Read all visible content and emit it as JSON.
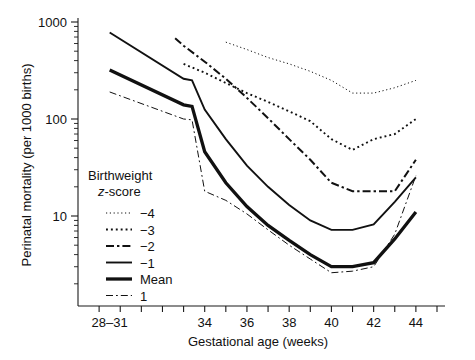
{
  "chart_data": {
    "type": "line",
    "title": "",
    "xlabel": "Gestational age (weeks)",
    "ylabel": "Perinatal mortality (per 1000 births)",
    "yscale": "log",
    "ylim": [
      1.2,
      1000
    ],
    "ytick_labels": [
      "1000",
      "100",
      "10"
    ],
    "ytick_values": [
      1000,
      100,
      10
    ],
    "xtick_labels": [
      "28–31",
      "34",
      "36",
      "38",
      "40",
      "42",
      "44"
    ],
    "xtick_values": [
      29.5,
      34,
      36,
      38,
      40,
      42,
      44
    ],
    "xlim": [
      28,
      45
    ],
    "grid": false,
    "legend_position": "inside-lower-left",
    "legend_title_line1": "Birthweight",
    "legend_title_line2_italic": "z",
    "legend_title_line2_rest": "-score",
    "series": [
      {
        "name": "−4",
        "style": "fine-dotted",
        "x": [
          35,
          36,
          37,
          38,
          39,
          40,
          41,
          42,
          43,
          44
        ],
        "values": [
          620,
          520,
          430,
          370,
          310,
          250,
          185,
          185,
          210,
          250
        ]
      },
      {
        "name": "−3",
        "style": "dotted",
        "x": [
          33,
          34,
          35,
          36,
          37,
          38,
          39,
          40,
          41,
          42,
          43,
          44
        ],
        "values": [
          370,
          300,
          235,
          185,
          150,
          120,
          95,
          62,
          48,
          62,
          70,
          100
        ]
      },
      {
        "name": "−2",
        "style": "dash-dot",
        "x": [
          32.6,
          33,
          34,
          35,
          36,
          37,
          38,
          39,
          40,
          41,
          42,
          43,
          44
        ],
        "values": [
          680,
          570,
          390,
          260,
          165,
          102,
          62,
          38,
          22,
          18,
          18,
          18,
          38
        ]
      },
      {
        "name": "−1",
        "style": "solid-thin",
        "x": [
          29.5,
          33,
          33.4,
          34,
          35,
          36,
          37,
          38,
          39,
          40,
          41,
          42,
          43,
          44
        ],
        "values": [
          780,
          260,
          250,
          125,
          62,
          33,
          20,
          13,
          9.0,
          7.2,
          7.2,
          8.2,
          14,
          25
        ]
      },
      {
        "name": "Mean",
        "style": "solid-thick",
        "x": [
          29.5,
          33,
          33.4,
          34,
          35,
          36,
          37,
          38,
          39,
          40,
          41,
          42,
          43,
          44
        ],
        "values": [
          320,
          140,
          135,
          46,
          22,
          12.5,
          8.0,
          5.6,
          4.0,
          3.0,
          3.0,
          3.3,
          5.8,
          11
        ]
      },
      {
        "name": "1",
        "style": "thin-dash-dot",
        "x": [
          29.5,
          33,
          33.4,
          34,
          35,
          36,
          37,
          38,
          39,
          40,
          41,
          42,
          43,
          44
        ],
        "values": [
          190,
          100,
          98,
          18,
          14.5,
          10.5,
          7.2,
          5.0,
          3.6,
          2.6,
          2.7,
          3.0,
          6.5,
          26
        ]
      }
    ],
    "legend_entries": [
      {
        "label": "−4",
        "style": "fine-dotted"
      },
      {
        "label": "−3",
        "style": "dotted"
      },
      {
        "label": "−2",
        "style": "dash-dot"
      },
      {
        "label": "−1",
        "style": "solid-thin"
      },
      {
        "label": "Mean",
        "style": "solid-thick"
      },
      {
        "label": "1",
        "style": "thin-dash-dot"
      }
    ],
    "colors": {
      "ink": "#111111",
      "background": "#ffffff"
    }
  }
}
